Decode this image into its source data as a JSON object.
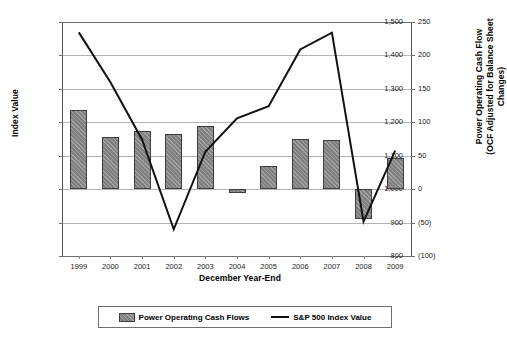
{
  "chart_data": {
    "type": "bar",
    "title": "",
    "xlabel": "December Year-End",
    "ylabel": "Index Value",
    "y2label": "Power Operating Cash  Flow (OCF Adjusted for Balance Sheet Changes)",
    "y2label_line1": "Power Operating Cash  Flow",
    "y2label_line2": "(OCF Adjusted for Balance Sheet Changes)",
    "categories": [
      "1999",
      "2000",
      "2001",
      "2002",
      "2003",
      "2004",
      "2005",
      "2006",
      "2007",
      "2008",
      "2009"
    ],
    "ylim": [
      800,
      1500
    ],
    "y2lim": [
      -100,
      250
    ],
    "yticks": [
      "800",
      "900",
      "1,000",
      "1,100",
      "1,200",
      "1,300",
      "1,400",
      "1,500"
    ],
    "ytick_values": [
      800,
      900,
      1000,
      1100,
      1200,
      1300,
      1400,
      1500
    ],
    "y2ticks": [
      "(100)",
      "(50)",
      "0",
      "50",
      "100",
      "150",
      "200",
      "250"
    ],
    "y2tick_values": [
      -100,
      -50,
      0,
      50,
      100,
      150,
      200,
      250
    ],
    "grid": true,
    "legend_position": "bottom",
    "series": [
      {
        "name": "Power Operating Cash Flows",
        "type": "bar",
        "axis": "right",
        "color": "#7f7f7f",
        "values": [
          118,
          78,
          87,
          82,
          94,
          -6,
          35,
          75,
          74,
          -44,
          47
        ]
      },
      {
        "name": "S&P 500 Index Value",
        "type": "line",
        "axis": "left",
        "color": "#111111",
        "values": [
          1469,
          1320,
          1148,
          880,
          1112,
          1212,
          1248,
          1418,
          1468,
          903,
          1115
        ]
      }
    ],
    "legend": [
      {
        "label": "Power Operating Cash Flows",
        "marker": "bar-swatch"
      },
      {
        "label": "S&P 500 Index Value",
        "marker": "line-swatch"
      }
    ]
  }
}
